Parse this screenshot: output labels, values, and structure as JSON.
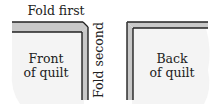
{
  "diagram": {
    "labels": {
      "fold_first": "Fold first",
      "fold_second": "Fold second",
      "front_line1": "Front",
      "front_line2": "of quilt",
      "back_line1": "Back",
      "back_line2": "of quilt"
    },
    "colors": {
      "quilt_fill": "#f4f4f4",
      "fold_band": "#c8c8c8",
      "outline": "#222222"
    }
  }
}
